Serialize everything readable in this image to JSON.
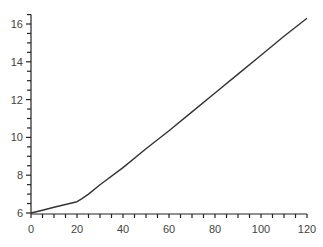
{
  "chart_data": {
    "type": "line",
    "title": "",
    "xlabel": "",
    "ylabel": "",
    "xlim": [
      0,
      120
    ],
    "ylim": [
      6,
      16.5
    ],
    "grid": false,
    "legend": null,
    "x_ticks": [
      0,
      20,
      40,
      60,
      80,
      100,
      120
    ],
    "y_ticks": [
      6,
      8,
      10,
      12,
      14,
      16
    ],
    "x_minor_step": 5,
    "y_minor_step": 0.5,
    "series": [
      {
        "name": "series-1",
        "color": "#333333",
        "x": [
          0,
          5,
          10,
          15,
          20,
          22,
          25,
          30,
          40,
          50,
          60,
          70,
          80,
          90,
          100,
          110,
          120
        ],
        "y": [
          6.0,
          6.15,
          6.3,
          6.45,
          6.6,
          6.75,
          7.0,
          7.5,
          8.4,
          9.4,
          10.35,
          11.35,
          12.35,
          13.35,
          14.35,
          15.35,
          16.3
        ]
      }
    ]
  }
}
